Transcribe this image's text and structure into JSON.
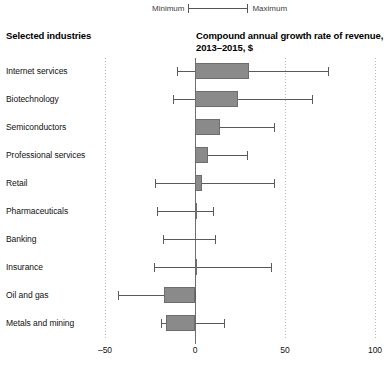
{
  "legend": {
    "min_label": "Minimum",
    "max_label": "Maximum",
    "rule_icon": "range-rule-icon"
  },
  "headers": {
    "left": "Selected industries",
    "right": "Compound annual growth rate of revenue, 2013–2015, $"
  },
  "chart_data": {
    "type": "bar",
    "title": "Compound annual growth rate of revenue, 2013–2015, $",
    "subtitle": "Selected industries",
    "orientation": "horizontal",
    "xlabel": "",
    "ylabel": "Selected industries",
    "xlim": [
      -50,
      100
    ],
    "xticks": [
      -50,
      0,
      50,
      100
    ],
    "xtick_labels": [
      "–50",
      "0",
      "50",
      "100"
    ],
    "grid": true,
    "grid_axis": "x",
    "legend_position": "top",
    "zero_reference_line": 0,
    "bar_series_name": "Median compound annual growth rate",
    "error_series_name": "Minimum to maximum range",
    "categories": [
      "Internet services",
      "Biotechnology",
      "Semiconductors",
      "Professional services",
      "Retail",
      "Pharmaceuticals",
      "Banking",
      "Insurance",
      "Oil and gas",
      "Metals and mining"
    ],
    "values": [
      30,
      24,
      14,
      7,
      4,
      1,
      0,
      1,
      -17,
      -16
    ],
    "minimum": [
      -10,
      -12,
      0,
      0,
      -22,
      -21,
      -18,
      -23,
      -43,
      -19
    ],
    "maximum": [
      74,
      65,
      44,
      29,
      44,
      10,
      11,
      42,
      0,
      16
    ],
    "rows": [
      {
        "label": "Internet services",
        "value": 30,
        "min": -10,
        "max": 74
      },
      {
        "label": "Biotechnology",
        "value": 24,
        "min": -12,
        "max": 65
      },
      {
        "label": "Semiconductors",
        "value": 14,
        "min": 0,
        "max": 44
      },
      {
        "label": "Professional services",
        "value": 7,
        "min": 0,
        "max": 29
      },
      {
        "label": "Retail",
        "value": 4,
        "min": -22,
        "max": 44
      },
      {
        "label": "Pharmaceuticals",
        "value": 1,
        "min": -21,
        "max": 10
      },
      {
        "label": "Banking",
        "value": 0,
        "min": -18,
        "max": 11
      },
      {
        "label": "Insurance",
        "value": 1,
        "min": -23,
        "max": 42
      },
      {
        "label": "Oil and gas",
        "value": -17,
        "min": -43,
        "max": 0
      },
      {
        "label": "Metals and mining",
        "value": -16,
        "min": -19,
        "max": 16
      }
    ],
    "colors": {
      "bar_fill": "#8a8a8a",
      "bar_stroke": "#6d6d6d",
      "whisker": "#5a5a5a",
      "gridline": "#b8b8b8",
      "zeroline": "#6e6e6e",
      "text": "#111111"
    }
  }
}
